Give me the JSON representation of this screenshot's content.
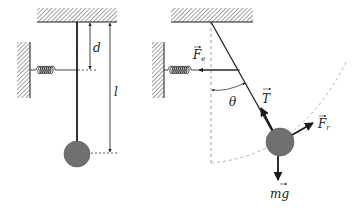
{
  "diagram": {
    "type": "physics-free-body-diagram",
    "colors": {
      "line": "#1a1a1a",
      "bob": "#707070",
      "dashed": "#888888",
      "arc": "#aaaaaa",
      "hatch": "#555555"
    },
    "left_figure": {
      "labels": {
        "d": "d",
        "l": "l"
      }
    },
    "right_figure": {
      "labels": {
        "spring_force": "F",
        "spring_force_sub": "e",
        "tension": "T",
        "angle": "θ",
        "restoring_force": "F",
        "restoring_force_sub": "r",
        "weight": "mg"
      }
    }
  }
}
